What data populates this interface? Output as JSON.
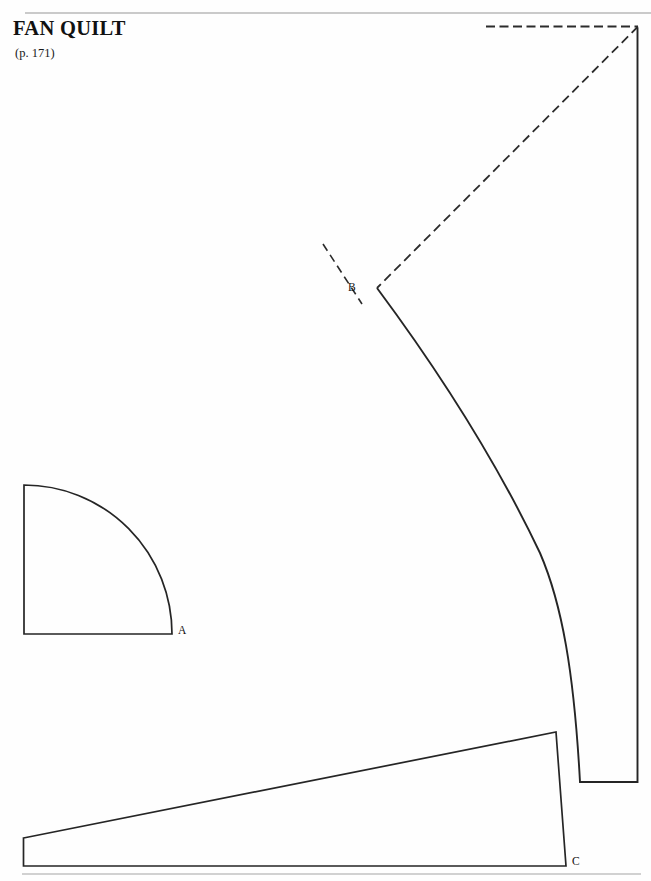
{
  "page": {
    "width": 651,
    "height": 881,
    "background_color": "#fefefe",
    "ink_color": "#262626",
    "rule_color": "#b9b9b9"
  },
  "header": {
    "title": "FAN QUILT",
    "subtitle": "(p. 171)"
  },
  "labels": {
    "a": "A",
    "b": "B",
    "c": "C"
  },
  "pattern": {
    "type": "quilt-template-sheet",
    "top_rule": {
      "x1": 25,
      "y1": 13,
      "x2": 651,
      "y2": 13
    },
    "bottom_rule": {
      "x1": 22,
      "y1": 874,
      "x2": 641,
      "y2": 874
    },
    "pieces": [
      {
        "name": "fan-blade",
        "label": "B",
        "label_point": {
          "x": 377,
          "y": 287
        },
        "description": "Large curved fan blade bounded by right vertical edge, bottom edge and a long arc from B"
      },
      {
        "name": "quarter-circle",
        "label": "A",
        "label_point": {
          "x": 172,
          "y": 634
        },
        "description": "Quarter circle template with vertical left edge and horizontal bottom edge"
      },
      {
        "name": "border-wedge",
        "label": "C",
        "label_point": {
          "x": 566,
          "y": 866
        },
        "description": "Long tapering wedge strip along the bottom of the sheet"
      }
    ],
    "guides": [
      {
        "name": "horizontal-dashed-guide",
        "x1": 486,
        "y1": 26,
        "x2": 638,
        "y2": 26
      },
      {
        "name": "diagonal-dashed-guide",
        "x1": 638,
        "y1": 26,
        "x2": 377,
        "y2": 288
      },
      {
        "name": "seam-tick-dashed",
        "x1": 323,
        "y1": 244,
        "x2": 362,
        "y2": 304
      }
    ]
  }
}
